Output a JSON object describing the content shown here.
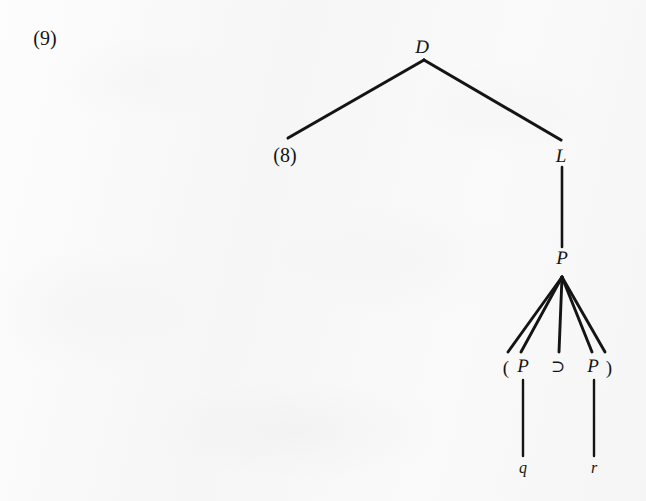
{
  "figure": {
    "number": "(9)",
    "type": "derivation-tree",
    "ink_color": "#141414",
    "paper_color": "#fbfafa"
  },
  "nodes": {
    "root": {
      "label": "D",
      "x": 422,
      "y": 47
    },
    "left_child_ref": {
      "label": "(8)",
      "x": 285,
      "y": 155
    },
    "right_child": {
      "label": "L",
      "x": 561,
      "y": 156
    },
    "proposition": {
      "label": "P",
      "x": 562,
      "y": 258
    },
    "expansion": [
      {
        "label": "(",
        "x": 506,
        "y": 367,
        "kind": "punct"
      },
      {
        "label": "P",
        "x": 523,
        "y": 366,
        "kind": "node"
      },
      {
        "label": "⊃",
        "x": 558,
        "y": 366,
        "kind": "operator"
      },
      {
        "label": "P",
        "x": 593,
        "y": 366,
        "kind": "node"
      },
      {
        "label": ")",
        "x": 609,
        "y": 367,
        "kind": "punct"
      }
    ],
    "terminals": [
      {
        "label": "q",
        "x": 523,
        "y": 468
      },
      {
        "label": "r",
        "x": 594,
        "y": 468
      }
    ]
  },
  "edges": [
    {
      "from": "D",
      "to": "(8)",
      "x1": 424,
      "y1": 60,
      "x2": 288,
      "y2": 138,
      "width": 3.1
    },
    {
      "from": "D",
      "to": "L",
      "x1": 424,
      "y1": 60,
      "x2": 561,
      "y2": 140,
      "width": 3.1
    },
    {
      "from": "L",
      "to": "P",
      "x1": 562,
      "y1": 167,
      "x2": 562,
      "y2": 247,
      "width": 2.6
    },
    {
      "from": "P",
      "to": "(",
      "x1": 562,
      "y1": 276,
      "x2": 508,
      "y2": 352,
      "width": 2.9
    },
    {
      "from": "P",
      "to": "P-left",
      "x1": 562,
      "y1": 276,
      "x2": 521,
      "y2": 352,
      "width": 2.9
    },
    {
      "from": "P",
      "to": "op",
      "x1": 562,
      "y1": 276,
      "x2": 559,
      "y2": 352,
      "width": 2.9
    },
    {
      "from": "P",
      "to": "P-right",
      "x1": 562,
      "y1": 276,
      "x2": 592,
      "y2": 352,
      "width": 2.9
    },
    {
      "from": "P",
      "to": ")",
      "x1": 562,
      "y1": 276,
      "x2": 605,
      "y2": 352,
      "width": 2.9
    },
    {
      "from": "P-left",
      "to": "q",
      "x1": 523,
      "y1": 380,
      "x2": 523,
      "y2": 456,
      "width": 2.4
    },
    {
      "from": "P-right",
      "to": "r",
      "x1": 594,
      "y1": 380,
      "x2": 594,
      "y2": 456,
      "width": 2.4
    }
  ]
}
